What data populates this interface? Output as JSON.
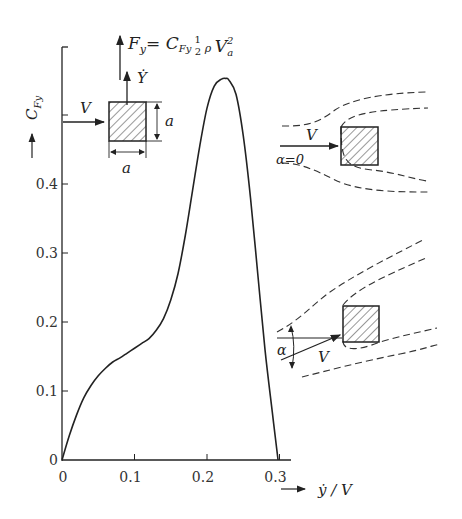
{
  "chart_data": {
    "type": "line",
    "title": "",
    "formula": {
      "lhs": "F",
      "lhs_sub": "y",
      "eq": "=",
      "coef": "C",
      "coef_sub": "Fy",
      "half_num": "1",
      "half_den": "2",
      "rho": "ρ",
      "vel": "V",
      "vel_sub": "a",
      "vel_sup": "2"
    },
    "xlabel": "ẏ / V",
    "ylabel": "C",
    "ylabel_sub": "Fy",
    "xlim": [
      0,
      0.32
    ],
    "ylim": [
      0,
      0.6
    ],
    "xticks": [
      "0",
      "0.1",
      "0.2",
      "0.3"
    ],
    "xtick_values": [
      0,
      0.1,
      0.2,
      0.3
    ],
    "yticks": [
      "0",
      "0.1",
      "0.2",
      "0.3",
      "0.4"
    ],
    "ytick_values": [
      0,
      0.1,
      0.2,
      0.3,
      0.4
    ],
    "ytick_unlabeled": [
      0.5,
      0.6
    ],
    "grid": false,
    "legend": null,
    "series": [
      {
        "name": "C_Fy vs ẏ/V",
        "x": [
          0,
          0.01,
          0.02,
          0.03,
          0.04,
          0.05,
          0.06,
          0.07,
          0.08,
          0.09,
          0.1,
          0.11,
          0.12,
          0.13,
          0.14,
          0.15,
          0.16,
          0.17,
          0.18,
          0.19,
          0.2,
          0.21,
          0.22,
          0.226,
          0.23,
          0.24,
          0.25,
          0.26,
          0.27,
          0.28,
          0.29,
          0.298
        ],
        "y": [
          0,
          0.035,
          0.065,
          0.09,
          0.108,
          0.122,
          0.133,
          0.142,
          0.148,
          0.155,
          0.162,
          0.169,
          0.176,
          0.188,
          0.205,
          0.232,
          0.27,
          0.325,
          0.39,
          0.455,
          0.51,
          0.542,
          0.552,
          0.553,
          0.551,
          0.53,
          0.47,
          0.38,
          0.27,
          0.16,
          0.07,
          0
        ]
      }
    ],
    "annotations": {
      "inset_top": {
        "velocity_label": "V",
        "ydot_label": "Ẏ",
        "side_label_vertical": "a",
        "side_label_horizontal": "a"
      },
      "flow_diagram_1": {
        "velocity_label": "V",
        "angle_label": "α=0"
      },
      "flow_diagram_2": {
        "velocity_label": "V",
        "angle_label": "α"
      }
    }
  }
}
